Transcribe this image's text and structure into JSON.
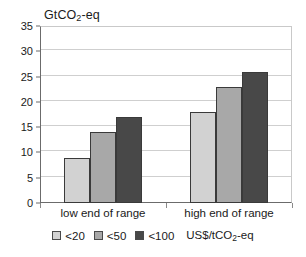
{
  "chart_data": {
    "type": "bar",
    "title": "",
    "subtitle": "",
    "xlabel": "",
    "ylabel": "GtCO2-eq",
    "ylabel_parts": {
      "pre": "GtCO",
      "sub": "2",
      "post": "-eq"
    },
    "categories": [
      "low end of range",
      "high end of range"
    ],
    "series": [
      {
        "name": "<20",
        "values": [
          9,
          18
        ],
        "color": "#d2d2d2"
      },
      {
        "name": "<50",
        "values": [
          14,
          23
        ],
        "color": "#a8a8a8"
      },
      {
        "name": "<100",
        "values": [
          17,
          26
        ],
        "color": "#484848"
      }
    ],
    "ylim": [
      0,
      35
    ],
    "ytick_step": 5,
    "yticks": [
      0,
      5,
      10,
      15,
      20,
      25,
      30,
      35
    ],
    "ytick_labels": [
      "0",
      "5",
      "10",
      "15",
      "20",
      "25",
      "30",
      "35"
    ],
    "grid": true,
    "grid_axis": "y",
    "legend_position": "bottom",
    "legend_unit": "US$/tCO2-eq",
    "legend_unit_parts": {
      "pre": "US$/tCO",
      "sub": "2",
      "post": "-eq"
    }
  }
}
